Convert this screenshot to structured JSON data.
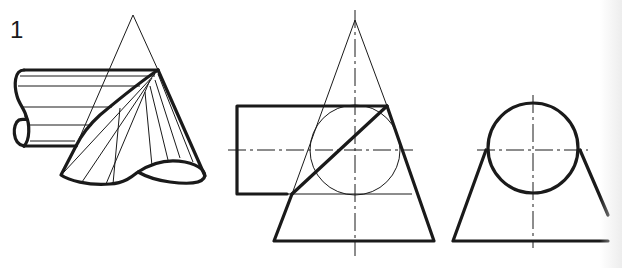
{
  "figure": {
    "label": "1",
    "views": [
      {
        "name": "isometric-view"
      },
      {
        "name": "front-view"
      },
      {
        "name": "side-view"
      }
    ]
  },
  "colors": {
    "ink": "#1a1a1a",
    "paper": "#ffffff"
  }
}
